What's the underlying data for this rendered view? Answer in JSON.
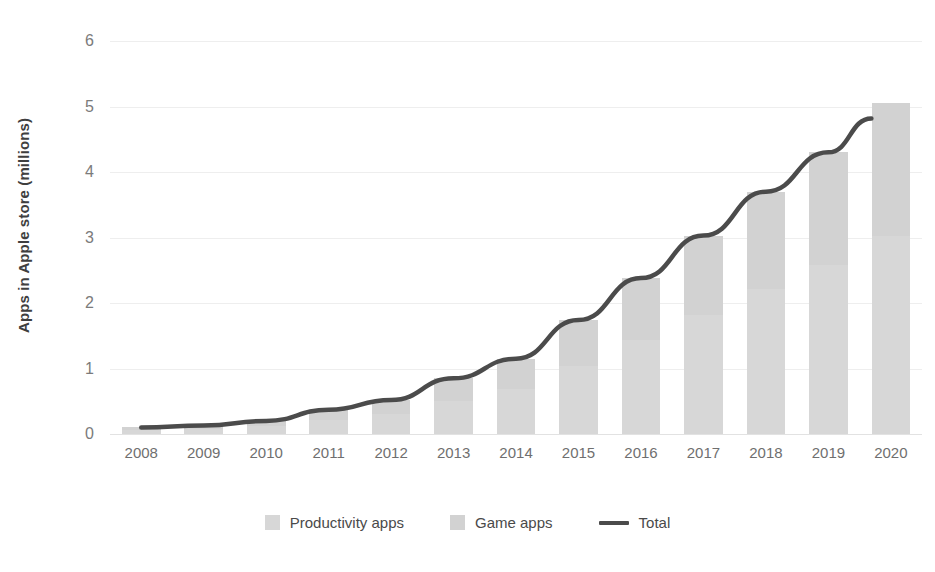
{
  "chart_data": {
    "type": "bar",
    "title": "",
    "subtitle": "",
    "xlabel": "",
    "ylabel": "Apps in Apple store (millions)",
    "categories": [
      "2008",
      "2009",
      "2010",
      "2011",
      "2012",
      "2013",
      "2014",
      "2015",
      "2016",
      "2017",
      "2018",
      "2019",
      "2020"
    ],
    "ylim": [
      0,
      6
    ],
    "yticks": [
      "0",
      "1",
      "2",
      "3",
      "4",
      "5",
      "6"
    ],
    "grid": true,
    "legend_position": "bottom-center",
    "series": [
      {
        "name": "Productivity apps",
        "type": "bar",
        "stacked": true,
        "color": "#d7d7d7",
        "values": [
          0.06,
          0.08,
          0.12,
          0.22,
          0.31,
          0.51,
          0.69,
          1.04,
          1.43,
          1.82,
          2.22,
          2.58,
          3.03
        ]
      },
      {
        "name": "Game apps",
        "type": "bar",
        "stacked": true,
        "color": "#d2d2d2",
        "values": [
          0.04,
          0.05,
          0.08,
          0.15,
          0.21,
          0.34,
          0.46,
          0.7,
          0.95,
          1.21,
          1.48,
          1.72,
          2.02
        ]
      },
      {
        "name": "Total",
        "type": "line",
        "color": "#4b4b4b",
        "values": [
          0.1,
          0.13,
          0.2,
          0.37,
          0.52,
          0.85,
          1.15,
          1.74,
          2.38,
          3.03,
          3.7,
          4.3,
          5.05
        ]
      }
    ]
  },
  "legend": {
    "items": [
      {
        "label": "Productivity apps",
        "marker": "square-swatch-productivity"
      },
      {
        "label": "Game apps",
        "marker": "square-swatch-game"
      },
      {
        "label": "Total",
        "marker": "line-swatch-total"
      }
    ]
  }
}
